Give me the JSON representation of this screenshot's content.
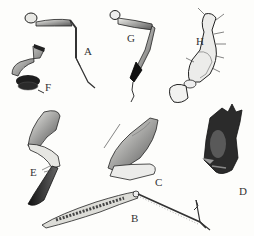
{
  "figure": {
    "colors": {
      "ink": "#1a1a1a",
      "mid": "#6e6e6e",
      "light": "#d8d8d4",
      "paper": "#fdfdfb"
    },
    "labels": [
      {
        "id": "A",
        "text": "A",
        "x": 84,
        "y": 46
      },
      {
        "id": "B",
        "text": "B",
        "x": 131,
        "y": 213
      },
      {
        "id": "C",
        "text": "C",
        "x": 155,
        "y": 177
      },
      {
        "id": "D",
        "text": "D",
        "x": 239,
        "y": 186
      },
      {
        "id": "E",
        "text": "E",
        "x": 30,
        "y": 167
      },
      {
        "id": "F",
        "text": "F",
        "x": 45,
        "y": 82
      },
      {
        "id": "G",
        "text": "G",
        "x": 127,
        "y": 33
      },
      {
        "id": "H",
        "text": "H",
        "x": 196,
        "y": 36
      }
    ]
  }
}
